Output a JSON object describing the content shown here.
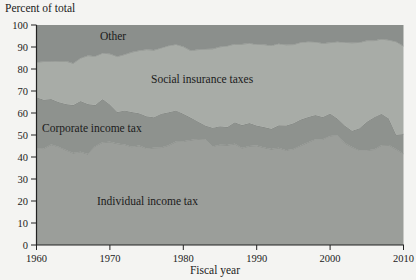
{
  "figure": {
    "background": "#f4f4f2",
    "axis_color": "#222222",
    "text_color": "#1b1b1b",
    "boundary_line_color": "#6f736f"
  },
  "chart_data": {
    "type": "area",
    "stacked": true,
    "title": "Percent of total",
    "xlabel": "Fiscal year",
    "ylabel": "",
    "xlim": [
      1960,
      2010
    ],
    "ylim": [
      0,
      100
    ],
    "grid": false,
    "legend_position": "labels-inside-areas",
    "yticks": [
      0,
      10,
      20,
      30,
      40,
      50,
      60,
      70,
      80,
      90,
      100
    ],
    "xticks": [
      1960,
      1970,
      1980,
      1990,
      2000,
      2010
    ],
    "x": [
      1960,
      1961,
      1962,
      1963,
      1964,
      1965,
      1966,
      1967,
      1968,
      1969,
      1970,
      1971,
      1972,
      1973,
      1974,
      1975,
      1976,
      1977,
      1978,
      1979,
      1980,
      1981,
      1982,
      1983,
      1984,
      1985,
      1986,
      1987,
      1988,
      1989,
      1990,
      1991,
      1992,
      1993,
      1994,
      1995,
      1996,
      1997,
      1998,
      1999,
      2000,
      2001,
      2002,
      2003,
      2004,
      2005,
      2006,
      2007,
      2008,
      2009,
      2010
    ],
    "series": [
      {
        "name": "Individual income tax",
        "color": "#9b9e9a",
        "values": [
          44.0,
          43.8,
          45.7,
          44.7,
          43.2,
          41.8,
          42.4,
          41.3,
          44.9,
          46.7,
          46.9,
          46.1,
          45.7,
          44.7,
          45.2,
          43.9,
          44.2,
          44.3,
          45.3,
          47.0,
          47.2,
          47.7,
          48.2,
          48.1,
          44.8,
          45.6,
          45.4,
          46.0,
          44.1,
          45.0,
          45.2,
          44.3,
          43.6,
          44.2,
          43.1,
          43.7,
          45.2,
          46.7,
          48.1,
          48.1,
          49.6,
          49.9,
          46.3,
          44.5,
          43.0,
          43.1,
          43.4,
          45.3,
          45.4,
          43.5,
          41.5
        ]
      },
      {
        "name": "Corporate income tax",
        "color": "#8e928e",
        "values": [
          23.2,
          22.2,
          20.6,
          20.3,
          20.9,
          21.8,
          23.0,
          22.8,
          18.7,
          19.6,
          17.0,
          14.3,
          15.5,
          15.7,
          14.7,
          14.6,
          13.9,
          15.4,
          15.0,
          14.2,
          12.5,
          10.2,
          8.0,
          6.2,
          8.5,
          8.4,
          8.2,
          9.8,
          10.4,
          10.4,
          9.1,
          9.3,
          9.2,
          10.2,
          11.2,
          11.6,
          11.8,
          11.5,
          11.0,
          10.1,
          10.2,
          7.6,
          8.0,
          7.4,
          10.1,
          12.9,
          14.7,
          14.4,
          12.1,
          6.6,
          8.9
        ]
      },
      {
        "name": "Social insurance taxes",
        "color": "#a8aca7",
        "values": [
          15.9,
          17.4,
          17.1,
          18.6,
          19.5,
          19.0,
          19.5,
          22.0,
          22.2,
          20.9,
          23.0,
          25.3,
          25.4,
          27.3,
          28.5,
          30.3,
          30.5,
          29.9,
          30.3,
          30.0,
          30.5,
          30.5,
          32.6,
          34.8,
          35.9,
          36.1,
          36.9,
          35.5,
          36.8,
          36.3,
          36.9,
          37.5,
          37.9,
          37.1,
          36.7,
          35.8,
          35.1,
          34.2,
          33.2,
          33.5,
          32.2,
          34.9,
          37.8,
          40.0,
          39.0,
          36.9,
          34.8,
          33.9,
          35.7,
          42.3,
          40.0
        ]
      },
      {
        "name": "Other",
        "color": "#8b8f8c",
        "values": [
          16.9,
          16.6,
          16.6,
          16.4,
          16.4,
          17.4,
          15.1,
          13.9,
          14.2,
          12.8,
          13.1,
          14.3,
          13.4,
          12.3,
          11.6,
          11.2,
          11.4,
          10.4,
          9.4,
          8.8,
          9.8,
          11.6,
          11.2,
          10.9,
          10.8,
          9.9,
          9.5,
          8.7,
          8.7,
          8.3,
          8.8,
          8.9,
          9.3,
          8.5,
          9.0,
          8.9,
          7.9,
          7.6,
          7.7,
          8.3,
          8.0,
          7.6,
          7.9,
          8.1,
          7.9,
          7.1,
          7.1,
          6.4,
          6.8,
          7.6,
          9.6
        ]
      }
    ]
  }
}
